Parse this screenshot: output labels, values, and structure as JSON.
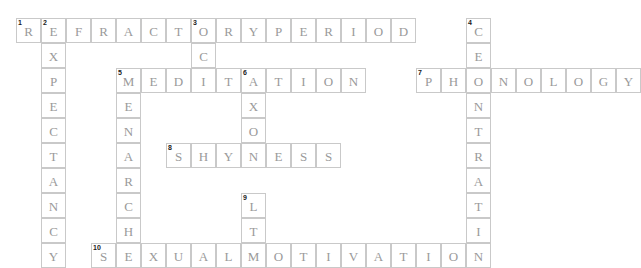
{
  "puzzle": {
    "title": "Psychology Crossword Grid",
    "cell_size": 25,
    "origin_x": 16,
    "origin_y": 18,
    "colors": {
      "cell_border": "#c9c9c9",
      "letter": "#9a9a9a",
      "clue_number": "#1a1a1a",
      "background": "#ffffff"
    },
    "entries": [
      {
        "number": "1",
        "direction": "across",
        "answer": "REFRACTORYPERIOD",
        "text": "REFRACTORY PERIOD",
        "length": 16,
        "row": 0,
        "col": 0,
        "letters": [
          "R",
          "E",
          "F",
          "R",
          "A",
          "C",
          "T",
          "O",
          "R",
          "Y",
          "P",
          "E",
          "R",
          "I",
          "O",
          "D"
        ]
      },
      {
        "number": "2",
        "direction": "down",
        "answer": "EXPECTANCY",
        "text": "EXPECTANCY",
        "length": 10,
        "row": 0,
        "col": 1,
        "letters": [
          "E",
          "X",
          "P",
          "E",
          "C",
          "T",
          "A",
          "N",
          "C",
          "Y"
        ]
      },
      {
        "number": "3",
        "direction": "down",
        "answer": "OCD",
        "text": "OCD",
        "length": 3,
        "row": 0,
        "col": 7,
        "letters": [
          "O",
          "C",
          "D"
        ]
      },
      {
        "number": "4",
        "direction": "down",
        "answer": "CENTRATION",
        "text": "CENTRATION",
        "length": 10,
        "row": 0,
        "col": 18,
        "letters": [
          "C",
          "E",
          "N",
          "T",
          "R",
          "A",
          "T",
          "I",
          "O",
          "N"
        ]
      },
      {
        "number": "5",
        "direction": "across",
        "answer": "MEDITATION",
        "text": "MEDITATION",
        "length": 10,
        "row": 2,
        "col": 4,
        "letters": [
          "M",
          "E",
          "D",
          "I",
          "T",
          "A",
          "T",
          "I",
          "O",
          "N"
        ]
      },
      {
        "number": "5",
        "direction": "down",
        "answer": "MENARCHE",
        "text": "MENARCHE",
        "length": 8,
        "row": 2,
        "col": 4,
        "letters": [
          "M",
          "E",
          "N",
          "A",
          "R",
          "C",
          "H",
          "E"
        ]
      },
      {
        "number": "6",
        "direction": "down",
        "answer": "AXON",
        "text": "AXON",
        "length": 4,
        "row": 2,
        "col": 10,
        "letters": [
          "A",
          "X",
          "O",
          "N"
        ]
      },
      {
        "number": "7",
        "direction": "across",
        "answer": "PHONOLOGY",
        "text": "PHONOLOGY",
        "length": 9,
        "row": 2,
        "col": 16,
        "letters": [
          "P",
          "H",
          "O",
          "N",
          "O",
          "L",
          "O",
          "G",
          "Y"
        ]
      },
      {
        "number": "8",
        "direction": "across",
        "answer": "SHYNESS",
        "text": "SHYNESS",
        "length": 7,
        "row": 5,
        "col": 7,
        "letters": [
          "S",
          "H",
          "Y",
          "N",
          "E",
          "S",
          "S"
        ]
      },
      {
        "number": "9",
        "direction": "down",
        "answer": "LTM",
        "text": "LTM",
        "length": 3,
        "row": 7,
        "col": 10,
        "letters": [
          "L",
          "T",
          "M"
        ]
      },
      {
        "number": "10",
        "direction": "across",
        "answer": "SEXUALMOTIVATION",
        "text": "SEXUAL MOTIVATION",
        "length": 16,
        "row": 9,
        "col": 4,
        "letters": [
          "S",
          "E",
          "X",
          "U",
          "A",
          "L",
          "M",
          "O",
          "T",
          "I",
          "V",
          "A",
          "T",
          "I",
          "O",
          "N"
        ]
      }
    ],
    "cells": [
      {
        "row": 0,
        "col": 0,
        "letter": "R",
        "number": "1"
      },
      {
        "row": 0,
        "col": 1,
        "letter": "E",
        "number": "2"
      },
      {
        "row": 0,
        "col": 2,
        "letter": "F",
        "number": ""
      },
      {
        "row": 0,
        "col": 3,
        "letter": "R",
        "number": ""
      },
      {
        "row": 0,
        "col": 4,
        "letter": "A",
        "number": ""
      },
      {
        "row": 0,
        "col": 5,
        "letter": "C",
        "number": ""
      },
      {
        "row": 0,
        "col": 6,
        "letter": "T",
        "number": ""
      },
      {
        "row": 0,
        "col": 7,
        "letter": "O",
        "number": "3"
      },
      {
        "row": 0,
        "col": 8,
        "letter": "R",
        "number": ""
      },
      {
        "row": 0,
        "col": 9,
        "letter": "Y",
        "number": ""
      },
      {
        "row": 0,
        "col": 10,
        "letter": "P",
        "number": ""
      },
      {
        "row": 0,
        "col": 11,
        "letter": "E",
        "number": ""
      },
      {
        "row": 0,
        "col": 12,
        "letter": "R",
        "number": ""
      },
      {
        "row": 0,
        "col": 13,
        "letter": "I",
        "number": ""
      },
      {
        "row": 0,
        "col": 14,
        "letter": "O",
        "number": ""
      },
      {
        "row": 0,
        "col": 15,
        "letter": "D",
        "number": ""
      },
      {
        "row": 0,
        "col": 18,
        "letter": "C",
        "number": "4"
      },
      {
        "row": 1,
        "col": 1,
        "letter": "X",
        "number": ""
      },
      {
        "row": 1,
        "col": 7,
        "letter": "C",
        "number": ""
      },
      {
        "row": 1,
        "col": 18,
        "letter": "E",
        "number": ""
      },
      {
        "row": 2,
        "col": 1,
        "letter": "P",
        "number": ""
      },
      {
        "row": 2,
        "col": 4,
        "letter": "M",
        "number": "5"
      },
      {
        "row": 2,
        "col": 5,
        "letter": "E",
        "number": ""
      },
      {
        "row": 2,
        "col": 6,
        "letter": "D",
        "number": ""
      },
      {
        "row": 2,
        "col": 7,
        "letter": "I",
        "number": ""
      },
      {
        "row": 2,
        "col": 8,
        "letter": "T",
        "number": ""
      },
      {
        "row": 2,
        "col": 9,
        "letter": "A",
        "number": "6"
      },
      {
        "row": 2,
        "col": 10,
        "letter": "T",
        "number": ""
      },
      {
        "row": 2,
        "col": 11,
        "letter": "I",
        "number": ""
      },
      {
        "row": 2,
        "col": 12,
        "letter": "O",
        "number": ""
      },
      {
        "row": 2,
        "col": 13,
        "letter": "N",
        "number": ""
      },
      {
        "row": 2,
        "col": 16,
        "letter": "P",
        "number": "7"
      },
      {
        "row": 2,
        "col": 17,
        "letter": "H",
        "number": ""
      },
      {
        "row": 2,
        "col": 18,
        "letter": "O",
        "number": ""
      },
      {
        "row": 2,
        "col": 19,
        "letter": "N",
        "number": ""
      },
      {
        "row": 2,
        "col": 20,
        "letter": "O",
        "number": ""
      },
      {
        "row": 2,
        "col": 21,
        "letter": "L",
        "number": ""
      },
      {
        "row": 2,
        "col": 22,
        "letter": "O",
        "number": ""
      },
      {
        "row": 2,
        "col": 23,
        "letter": "G",
        "number": ""
      },
      {
        "row": 2,
        "col": 24,
        "letter": "Y",
        "number": ""
      },
      {
        "row": 3,
        "col": 1,
        "letter": "E",
        "number": ""
      },
      {
        "row": 3,
        "col": 4,
        "letter": "E",
        "number": ""
      },
      {
        "row": 3,
        "col": 9,
        "letter": "X",
        "number": ""
      },
      {
        "row": 3,
        "col": 18,
        "letter": "N",
        "number": ""
      },
      {
        "row": 4,
        "col": 1,
        "letter": "C",
        "number": ""
      },
      {
        "row": 4,
        "col": 4,
        "letter": "N",
        "number": ""
      },
      {
        "row": 4,
        "col": 9,
        "letter": "O",
        "number": ""
      },
      {
        "row": 4,
        "col": 18,
        "letter": "T",
        "number": ""
      },
      {
        "row": 5,
        "col": 1,
        "letter": "T",
        "number": ""
      },
      {
        "row": 5,
        "col": 4,
        "letter": "A",
        "number": ""
      },
      {
        "row": 5,
        "col": 6,
        "letter": "S",
        "number": "8"
      },
      {
        "row": 5,
        "col": 7,
        "letter": "H",
        "number": ""
      },
      {
        "row": 5,
        "col": 8,
        "letter": "Y",
        "number": ""
      },
      {
        "row": 5,
        "col": 9,
        "letter": "N",
        "number": ""
      },
      {
        "row": 5,
        "col": 10,
        "letter": "E",
        "number": ""
      },
      {
        "row": 5,
        "col": 11,
        "letter": "S",
        "number": ""
      },
      {
        "row": 5,
        "col": 12,
        "letter": "S",
        "number": ""
      },
      {
        "row": 5,
        "col": 18,
        "letter": "R",
        "number": ""
      },
      {
        "row": 6,
        "col": 1,
        "letter": "A",
        "number": ""
      },
      {
        "row": 6,
        "col": 4,
        "letter": "R",
        "number": ""
      },
      {
        "row": 6,
        "col": 18,
        "letter": "A",
        "number": ""
      },
      {
        "row": 7,
        "col": 1,
        "letter": "N",
        "number": ""
      },
      {
        "row": 7,
        "col": 4,
        "letter": "C",
        "number": ""
      },
      {
        "row": 7,
        "col": 9,
        "letter": "L",
        "number": "9"
      },
      {
        "row": 7,
        "col": 18,
        "letter": "T",
        "number": ""
      },
      {
        "row": 8,
        "col": 1,
        "letter": "C",
        "number": ""
      },
      {
        "row": 8,
        "col": 4,
        "letter": "H",
        "number": ""
      },
      {
        "row": 8,
        "col": 9,
        "letter": "T",
        "number": ""
      },
      {
        "row": 8,
        "col": 18,
        "letter": "I",
        "number": ""
      },
      {
        "row": 9,
        "col": 1,
        "letter": "Y",
        "number": ""
      },
      {
        "row": 9,
        "col": 3,
        "letter": "S",
        "number": "10"
      },
      {
        "row": 9,
        "col": 4,
        "letter": "E",
        "number": ""
      },
      {
        "row": 9,
        "col": 5,
        "letter": "X",
        "number": ""
      },
      {
        "row": 9,
        "col": 6,
        "letter": "U",
        "number": ""
      },
      {
        "row": 9,
        "col": 7,
        "letter": "A",
        "number": ""
      },
      {
        "row": 9,
        "col": 8,
        "letter": "L",
        "number": ""
      },
      {
        "row": 9,
        "col": 9,
        "letter": "M",
        "number": ""
      },
      {
        "row": 9,
        "col": 10,
        "letter": "O",
        "number": ""
      },
      {
        "row": 9,
        "col": 11,
        "letter": "T",
        "number": ""
      },
      {
        "row": 9,
        "col": 12,
        "letter": "I",
        "number": ""
      },
      {
        "row": 9,
        "col": 13,
        "letter": "V",
        "number": ""
      },
      {
        "row": 9,
        "col": 14,
        "letter": "A",
        "number": ""
      },
      {
        "row": 9,
        "col": 15,
        "letter": "T",
        "number": ""
      },
      {
        "row": 9,
        "col": 16,
        "letter": "I",
        "number": ""
      },
      {
        "row": 9,
        "col": 17,
        "letter": "O",
        "number": ""
      },
      {
        "row": 9,
        "col": 18,
        "letter": "N",
        "number": ""
      }
    ]
  }
}
